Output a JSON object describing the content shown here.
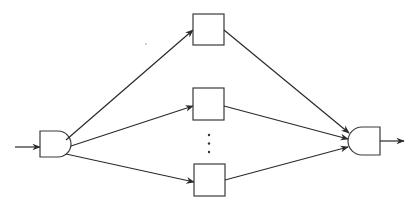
{
  "diagram": {
    "stroke_color": "#2a2a2a",
    "background": "#ffffff",
    "nodes": [
      {
        "id": "input",
        "type": "arrow-in"
      },
      {
        "id": "split-gate",
        "type": "and-gate",
        "orientation": "right"
      },
      {
        "id": "block-1",
        "type": "box",
        "position": "top"
      },
      {
        "id": "block-2",
        "type": "box",
        "position": "middle"
      },
      {
        "id": "ellipsis",
        "type": "vertical-dots",
        "text": "⋮"
      },
      {
        "id": "block-n",
        "type": "box",
        "position": "bottom"
      },
      {
        "id": "merge-gate",
        "type": "gate",
        "orientation": "curved-left"
      },
      {
        "id": "output",
        "type": "arrow-out"
      }
    ],
    "edges": [
      {
        "from": "input",
        "to": "split-gate"
      },
      {
        "from": "split-gate",
        "to": "block-1"
      },
      {
        "from": "split-gate",
        "to": "block-2"
      },
      {
        "from": "split-gate",
        "to": "block-n"
      },
      {
        "from": "block-1",
        "to": "merge-gate"
      },
      {
        "from": "block-2",
        "to": "merge-gate"
      },
      {
        "from": "block-n",
        "to": "merge-gate"
      },
      {
        "from": "merge-gate",
        "to": "output"
      }
    ],
    "ellipsis_text": "⋮"
  }
}
